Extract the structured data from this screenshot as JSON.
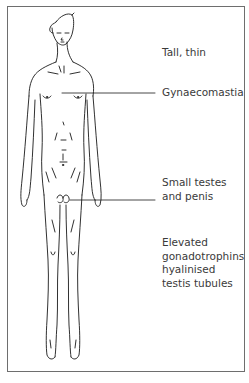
{
  "figure": {
    "line_color": "#1a1a1a",
    "frame_color": "#6e6e6e"
  },
  "labels": {
    "tall_thin": "Tall, thin",
    "gynaecomastia": "Gynaecomastia",
    "small_testes": {
      "line1": "Small testes",
      "line2": "and penis"
    },
    "elevated": {
      "line1": "Elevated",
      "line2": "gonadotrophins",
      "line3": "hyalinised",
      "line4": "testis tubules"
    }
  }
}
